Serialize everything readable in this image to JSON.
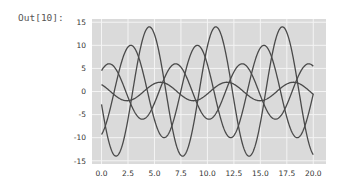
{
  "cell": {
    "prompt": "Out[10]:"
  },
  "colors": {
    "plot_background": "#dadada",
    "grid": "#f4f4f4",
    "line": "#4a4a4a",
    "tick_text": "#333333"
  },
  "chart_data": {
    "type": "line",
    "title": "",
    "xlabel": "",
    "ylabel": "",
    "xlim": [
      -0.9,
      21.2
    ],
    "ylim": [
      -15.7,
      15.7
    ],
    "grid": true,
    "legend": null,
    "x_ticks": [
      0.0,
      2.5,
      5.0,
      7.5,
      10.0,
      12.5,
      15.0,
      17.5,
      20.0
    ],
    "x_tick_labels": [
      "0.0",
      "2.5",
      "5.0",
      "7.5",
      "10.0",
      "12.5",
      "15.0",
      "17.5",
      "20.0"
    ],
    "y_ticks": [
      15,
      10,
      5,
      0,
      -5,
      -10,
      -15
    ],
    "y_tick_labels": [
      "15",
      "10",
      "5",
      "0",
      "-5",
      "-10",
      "-15"
    ],
    "x_range": [
      0,
      20
    ],
    "series": [
      {
        "name": "line1",
        "formula": "-14*sin(x+0.2)",
        "amplitude": 14,
        "phase": 0.2,
        "sign": -1
      },
      {
        "name": "line2",
        "formula": "10*sin(x-1.2)",
        "amplitude": 10,
        "phase": -1.2,
        "sign": 1
      },
      {
        "name": "line3",
        "formula": "6*sin(x+0.85)",
        "amplitude": 6,
        "phase": 0.85,
        "sign": 1
      },
      {
        "name": "line4",
        "formula": "2*sin(x+2.3)",
        "amplitude": 2,
        "phase": 2.3,
        "sign": 1
      }
    ]
  }
}
